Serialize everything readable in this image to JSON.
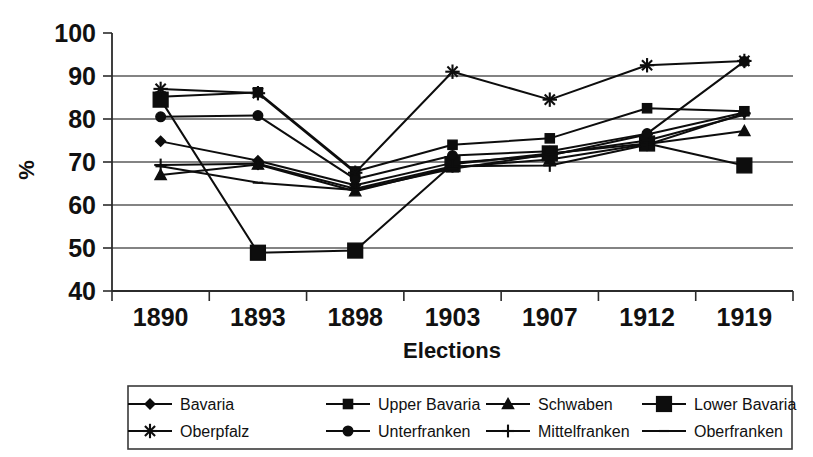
{
  "chart_data": {
    "type": "line",
    "title": "",
    "xlabel": "Elections",
    "ylabel": "%",
    "categories": [
      "1890",
      "1893",
      "1898",
      "1903",
      "1907",
      "1912",
      "1919"
    ],
    "ylim": [
      40,
      100
    ],
    "yticks": [
      40,
      50,
      60,
      70,
      80,
      90,
      100
    ],
    "ytick_labels": [
      "40",
      "50",
      "60",
      "70",
      "80",
      "90",
      "100"
    ],
    "grid": true,
    "legend_position": "bottom",
    "series": [
      {
        "name": "Bavaria",
        "marker": "diamond",
        "values": [
          74.8,
          70.3,
          64.6,
          69.8,
          71.5,
          76.4,
          81.5
        ]
      },
      {
        "name": "Upper Bavaria",
        "marker": "square",
        "values": [
          85.2,
          86.2,
          67.8,
          74.0,
          75.5,
          82.5,
          81.8
        ]
      },
      {
        "name": "Schwaben",
        "marker": "triangle",
        "values": [
          67.0,
          69.4,
          63.2,
          68.8,
          70.6,
          74.2,
          77.2
        ]
      },
      {
        "name": "Lower Bavaria",
        "marker": "big-square",
        "values": [
          84.5,
          48.9,
          49.4,
          69.5,
          72.0,
          74.3,
          69.2
        ]
      },
      {
        "name": "Oberpfalz",
        "marker": "asterisk",
        "values": [
          87.0,
          86.0,
          67.5,
          91.0,
          84.5,
          92.5,
          93.5
        ]
      },
      {
        "name": "Unterfranken",
        "marker": "circle",
        "values": [
          80.5,
          80.8,
          66.0,
          71.5,
          72.5,
          76.6,
          93.4
        ]
      },
      {
        "name": "Mittelfranken",
        "marker": "plus",
        "values": [
          69.3,
          69.6,
          63.8,
          69.0,
          69.2,
          74.0,
          81.3
        ]
      },
      {
        "name": "Oberfranken",
        "marker": "dash",
        "values": [
          69.0,
          65.2,
          63.5,
          68.4,
          71.8,
          75.0,
          81.0
        ]
      }
    ]
  },
  "axis": {
    "ylabel": "%",
    "xlabel": "Elections"
  },
  "legend": {
    "row1": [
      {
        "label": "Bavaria",
        "marker": "diamond-marker-icon"
      },
      {
        "label": "Upper Bavaria",
        "marker": "square-marker-icon"
      },
      {
        "label": "Schwaben",
        "marker": "triangle-marker-icon"
      },
      {
        "label": "Lower Bavaria",
        "marker": "big-square-marker-icon"
      }
    ],
    "row2": [
      {
        "label": "Oberpfalz",
        "marker": "asterisk-marker-icon"
      },
      {
        "label": "Unterfranken",
        "marker": "circle-marker-icon"
      },
      {
        "label": "Mittelfranken",
        "marker": "plus-marker-icon"
      },
      {
        "label": "Oberfranken",
        "marker": "dash-marker-icon"
      }
    ]
  },
  "colors": {
    "ink": "#0d0d0d",
    "grid": "#5a5a5a",
    "background": "#ffffff"
  }
}
